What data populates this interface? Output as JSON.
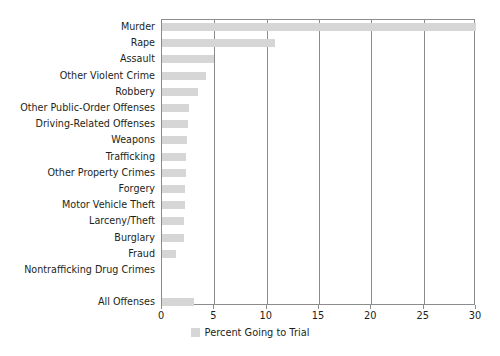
{
  "chart_data": {
    "type": "bar",
    "orientation": "horizontal",
    "title": "",
    "xlabel": "Percent Going to Trial",
    "ylabel": "",
    "xlim": [
      0,
      30
    ],
    "xticks": [
      0,
      5,
      10,
      15,
      20,
      25,
      30
    ],
    "grid": true,
    "legend": {
      "position": "bottom-center",
      "entries": [
        {
          "label": "Percent Going to Trial",
          "color": "#d6d6d6"
        }
      ]
    },
    "categories": [
      "Murder",
      "Rape",
      "Assault",
      "Other Violent Crime",
      "Robbery",
      "Other Public-Order Offenses",
      "Driving-Related Offenses",
      "Weapons",
      "Trafficking",
      "Other Property Crimes",
      "Forgery",
      "Motor Vehicle Theft",
      "Larceny/Theft",
      "Burglary",
      "Fraud",
      "Nontrafficking Drug Crimes",
      "",
      "All Offenses"
    ],
    "values": [
      30.0,
      10.8,
      5.0,
      4.2,
      3.4,
      2.6,
      2.5,
      2.4,
      2.3,
      2.3,
      2.2,
      2.2,
      2.1,
      2.1,
      1.3,
      0.0,
      null,
      3.1
    ],
    "series": [
      {
        "name": "Percent Going to Trial",
        "color": "#d6d6d6",
        "values": [
          30.0,
          10.8,
          5.0,
          4.2,
          3.4,
          2.6,
          2.5,
          2.4,
          2.3,
          2.3,
          2.2,
          2.2,
          2.1,
          2.1,
          1.3,
          0.0,
          null,
          3.1
        ]
      }
    ]
  },
  "caption": ""
}
